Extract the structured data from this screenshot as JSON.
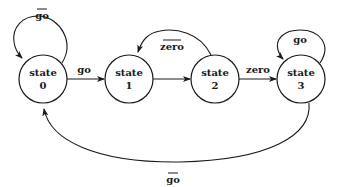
{
  "diagram": {
    "type": "finite-state-machine",
    "states": [
      {
        "id": "s0",
        "line1": "state",
        "line2": "0"
      },
      {
        "id": "s1",
        "line1": "state",
        "line2": "1"
      },
      {
        "id": "s2",
        "line1": "state",
        "line2": "2"
      },
      {
        "id": "s3",
        "line1": "state",
        "line2": "3"
      }
    ],
    "transitions": [
      {
        "from": "s0",
        "to": "s0",
        "label": "go",
        "negated": true
      },
      {
        "from": "s0",
        "to": "s1",
        "label": "go",
        "negated": false
      },
      {
        "from": "s1",
        "to": "s2",
        "label": "",
        "negated": false
      },
      {
        "from": "s2",
        "to": "s1",
        "label": "zero",
        "negated": true
      },
      {
        "from": "s2",
        "to": "s3",
        "label": "zero",
        "negated": false
      },
      {
        "from": "s3",
        "to": "s3",
        "label": "go",
        "negated": false
      },
      {
        "from": "s3",
        "to": "s0",
        "label": "go",
        "negated": true
      }
    ],
    "colors": {
      "stroke": "#1a1a1a",
      "background": "#ffffff"
    }
  }
}
